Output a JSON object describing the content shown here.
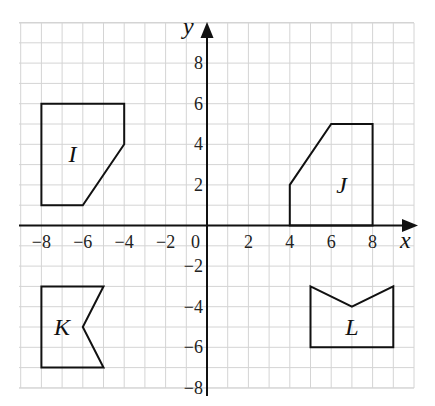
{
  "figure": {
    "type": "coordinate-grid",
    "x_axis": {
      "label": "x",
      "min": -9,
      "max": 10,
      "ticks": [
        -8,
        -6,
        -4,
        -2,
        0,
        2,
        4,
        6,
        8
      ]
    },
    "y_axis": {
      "label": "y",
      "min": -8,
      "max": 10,
      "ticks": [
        8,
        6,
        4,
        2,
        -2,
        -4,
        -6,
        -8
      ]
    },
    "origin_label": "0",
    "grid_color": "#d4d4d4",
    "line_color": "#111111",
    "shapes": [
      {
        "name": "I",
        "label": "I",
        "vertices": [
          [
            -8,
            6
          ],
          [
            -4,
            6
          ],
          [
            -4,
            4
          ],
          [
            -6,
            1
          ],
          [
            -8,
            1
          ]
        ],
        "label_pos": [
          -6.5,
          3.5
        ]
      },
      {
        "name": "J",
        "label": "J",
        "vertices": [
          [
            4,
            0
          ],
          [
            4,
            2
          ],
          [
            6,
            5
          ],
          [
            8,
            5
          ],
          [
            8,
            0
          ]
        ],
        "label_pos": [
          6.5,
          2
        ]
      },
      {
        "name": "K",
        "label": "K",
        "vertices": [
          [
            -8,
            -3
          ],
          [
            -5,
            -3
          ],
          [
            -6,
            -5
          ],
          [
            -5,
            -7
          ],
          [
            -8,
            -7
          ]
        ],
        "label_pos": [
          -7,
          -5
        ]
      },
      {
        "name": "L",
        "label": "L",
        "vertices": [
          [
            5,
            -3
          ],
          [
            7,
            -4
          ],
          [
            9,
            -3
          ],
          [
            9,
            -6
          ],
          [
            5,
            -6
          ]
        ],
        "label_pos": [
          7,
          -5
        ]
      }
    ]
  }
}
